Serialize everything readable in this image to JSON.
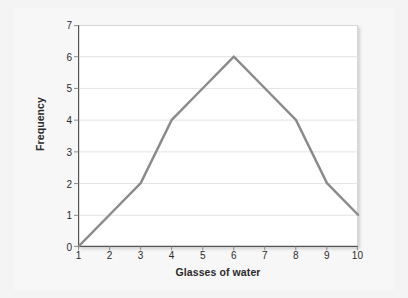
{
  "chart_data": {
    "type": "line",
    "title": "",
    "subtitle": "",
    "xlabel": "Glasses of water",
    "ylabel": "Frequency",
    "x": [
      1,
      2,
      3,
      4,
      5,
      6,
      7,
      8,
      9,
      10
    ],
    "values": [
      0,
      1,
      2,
      4,
      5,
      6,
      5,
      4,
      2,
      1
    ],
    "series": [
      {
        "name": "Frequency",
        "values": [
          0,
          1,
          2,
          4,
          5,
          6,
          5,
          4,
          2,
          1
        ]
      }
    ],
    "xlim": [
      1,
      10
    ],
    "ylim": [
      0,
      7
    ],
    "xticks": [
      "1",
      "2",
      "3",
      "4",
      "5",
      "6",
      "7",
      "8",
      "9",
      "10"
    ],
    "yticks": [
      "0",
      "1",
      "2",
      "3",
      "4",
      "5",
      "6",
      "7"
    ],
    "grid": "horizontal",
    "legend": "none",
    "line_color": "#8a8a8a",
    "grid_color": "#e3e3e3",
    "axis_color": "#555555",
    "plot_background": "#ffffff",
    "figure_background": "#f4f4f4",
    "markers": "none",
    "annotations": []
  }
}
